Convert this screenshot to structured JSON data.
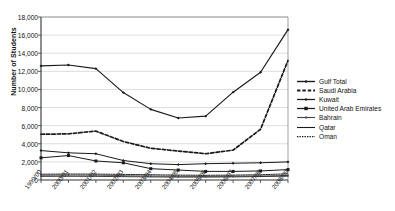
{
  "chart_data": {
    "type": "line",
    "title": "",
    "xlabel": "",
    "ylabel": "Number of Students",
    "ylim": [
      0,
      18000
    ],
    "ytick_step": 2000,
    "grid": true,
    "legend_position": "right",
    "categories": [
      "1999/00",
      "2000/01",
      "2001/02",
      "2002/03",
      "2003/04",
      "2004/05",
      "2005/06",
      "2006/07",
      "2007/08",
      "2008/09"
    ],
    "yticks": [
      "0",
      "2,000",
      "4,000",
      "6,000",
      "8,000",
      "10,000",
      "12,000",
      "14,000",
      "16,000",
      "18,000"
    ],
    "series": [
      {
        "name": "Gulf Total",
        "style": "solid-marker",
        "color": "#1a1a1a",
        "values": [
          12600,
          12700,
          12300,
          9650,
          7800,
          6850,
          7050,
          9700,
          11900,
          16600
        ]
      },
      {
        "name": "Saudi Arabia",
        "style": "dashed-heavy",
        "color": "#1a1a1a",
        "values": [
          5050,
          5100,
          5400,
          4250,
          3500,
          3200,
          2900,
          3300,
          5600,
          13200
        ]
      },
      {
        "name": "Kuwait",
        "style": "solid-thin-marker",
        "color": "#1a1a1a",
        "values": [
          3250,
          3000,
          2900,
          2150,
          1800,
          1700,
          1800,
          1850,
          1900,
          2000
        ]
      },
      {
        "name": "United Arab Emirates",
        "style": "solid-square",
        "color": "#1a1a1a",
        "values": [
          2450,
          2700,
          2100,
          1900,
          1250,
          1100,
          950,
          950,
          1000,
          1150
        ]
      },
      {
        "name": "Bahrain",
        "style": "solid-light",
        "color": "#444444",
        "values": [
          520,
          540,
          530,
          480,
          440,
          410,
          400,
          420,
          450,
          500
        ]
      },
      {
        "name": "Qatar",
        "style": "solid-plain",
        "color": "#1a1a1a",
        "values": [
          400,
          410,
          400,
          370,
          340,
          320,
          320,
          340,
          380,
          430
        ]
      },
      {
        "name": "Oman",
        "style": "dotted",
        "color": "#1a1a1a",
        "values": [
          640,
          660,
          650,
          620,
          580,
          540,
          520,
          540,
          580,
          680
        ]
      }
    ]
  },
  "legend": {
    "items": [
      {
        "label": "Gulf Total"
      },
      {
        "label": "Saudi Arabia"
      },
      {
        "label": "Kuwait"
      },
      {
        "label": "United Arab Emirates"
      },
      {
        "label": "Bahrain"
      },
      {
        "label": "Qatar"
      },
      {
        "label": "Oman"
      }
    ]
  }
}
